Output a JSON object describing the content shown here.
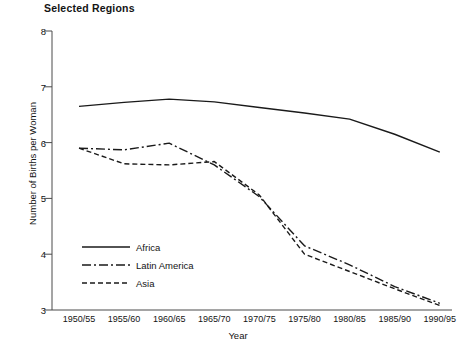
{
  "chart_data": {
    "type": "line",
    "title": "Selected Regions",
    "xlabel": "Year",
    "ylabel": "Number of Births per Woman",
    "categories": [
      "1950/55",
      "1955/60",
      "1960/65",
      "1965/70",
      "1970/75",
      "1975/80",
      "1980/85",
      "1985/90",
      "1990/95"
    ],
    "ylim": [
      3,
      8
    ],
    "yticks": [
      3,
      4,
      5,
      6,
      7,
      8
    ],
    "ytick_labels": [
      "3",
      "4",
      "5",
      "6",
      "7",
      "8"
    ],
    "grid": false,
    "legend_position": "inside-lower-left",
    "series": [
      {
        "name": "Africa",
        "style": "solid",
        "values": [
          6.65,
          6.72,
          6.78,
          6.73,
          6.63,
          6.53,
          6.42,
          6.15,
          5.83
        ]
      },
      {
        "name": "Latin America",
        "style": "dash-dot",
        "values": [
          5.9,
          5.87,
          5.99,
          5.6,
          5.03,
          4.15,
          3.81,
          3.42,
          3.12
        ]
      },
      {
        "name": "Asia",
        "style": "dashed",
        "values": [
          5.9,
          5.62,
          5.6,
          5.66,
          5.06,
          4.0,
          3.69,
          3.38,
          3.08
        ]
      }
    ]
  },
  "title": "Selected Regions",
  "axes": {
    "y_title": "Number of Births per Woman",
    "x_title": "Year",
    "y_labels": [
      "8",
      "7",
      "6",
      "5",
      "4",
      "3"
    ],
    "x_labels": [
      "1950/55",
      "1955/60",
      "1960/65",
      "1965/70",
      "1970/75",
      "1975/80",
      "1980/85",
      "1985/90",
      "1990/95"
    ]
  },
  "legend": {
    "items": [
      {
        "label": "Africa"
      },
      {
        "label": "Latin America"
      },
      {
        "label": "Asia"
      }
    ]
  }
}
